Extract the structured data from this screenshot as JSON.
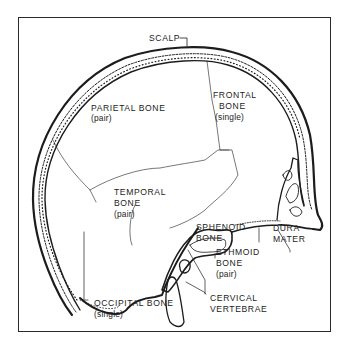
{
  "diagram": {
    "type": "anatomical illustration",
    "colors": {
      "ink": "#1c1c1c",
      "background": "#ffffff",
      "frame": "#2a2a2a"
    }
  },
  "labels": {
    "scalp": "SCALP",
    "parietal": {
      "name": "PARIETAL BONE",
      "note": "(pair)"
    },
    "frontal": {
      "name_line1": "FRONTAL",
      "name_line2": "BONE",
      "note": "(single)"
    },
    "temporal": {
      "name_line1": "TEMPORAL",
      "name_line2": "BONE",
      "note": "(pair)"
    },
    "sphenoid": {
      "name_line1": "SPHENOID",
      "name_line2": "BONE"
    },
    "dura": {
      "line1": "DURA",
      "line2": "MATER"
    },
    "ethmoid": {
      "name_line1": "ETHMOID",
      "name_line2": "BONE",
      "note": "(pair)"
    },
    "cervical": {
      "line1": "CERVICAL",
      "line2": "VERTEBRAE"
    },
    "occipital": {
      "name": "OCCIPITAL BONE",
      "note": "(single)"
    }
  }
}
